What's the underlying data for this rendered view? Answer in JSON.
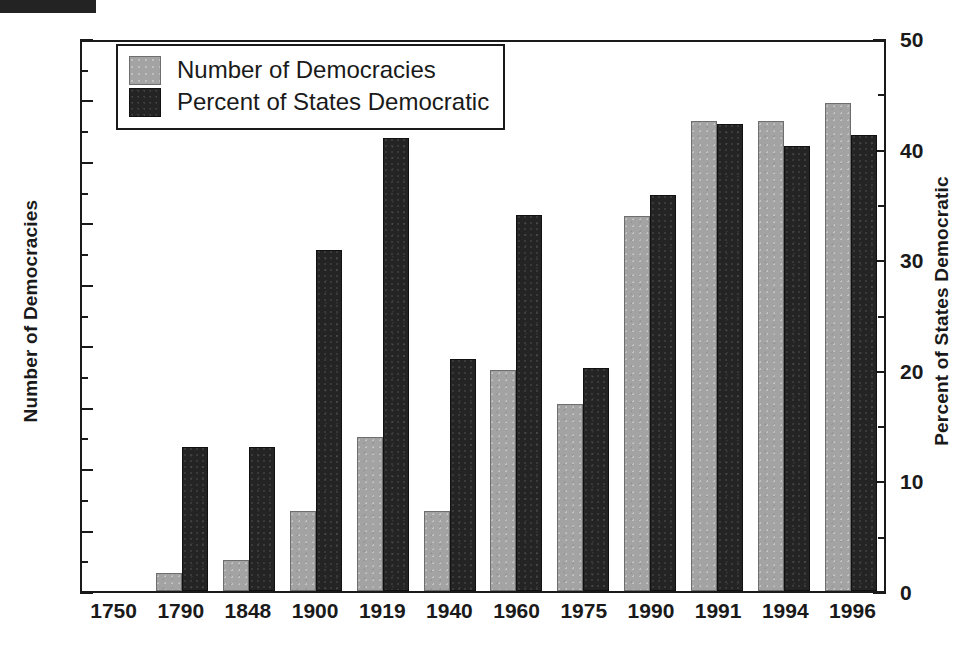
{
  "chart_data": {
    "type": "bar",
    "title": "",
    "subtitle": "",
    "xlabel": "",
    "ylabel": "Number of Democracies",
    "y2label": "Percent of States Democratic",
    "categories": [
      "1750",
      "1790",
      "1848",
      "1900",
      "1919",
      "1940",
      "1960",
      "1975",
      "1990",
      "1991",
      "1994",
      "1996"
    ],
    "series": [
      {
        "name": "Number of Democracies",
        "axis": "left",
        "color": "#a3a3a3",
        "values": [
          0,
          3,
          5,
          13,
          25,
          13,
          36,
          30.5,
          61,
          76.5,
          76.5,
          79.5
        ]
      },
      {
        "name": "Percent of States Democratic",
        "axis": "right",
        "color": "#242424",
        "values": [
          0,
          13,
          13,
          30.8,
          41,
          21,
          34,
          20.2,
          35.8,
          42.2,
          40.2,
          41.2
        ]
      }
    ],
    "ylim": [
      0,
      90
    ],
    "ytick_step": 10,
    "yticks": [
      0,
      10,
      20,
      30,
      40,
      50,
      60,
      70,
      80,
      90
    ],
    "y2lim": [
      0,
      50
    ],
    "y2tick_step": 10,
    "y2ticks": [
      0,
      10,
      20,
      30,
      40,
      50
    ],
    "minor_ticks": true,
    "grid": false,
    "legend_position": "top-left",
    "legend_entries": [
      "Number of Democracies",
      "Percent of States Democratic"
    ]
  },
  "legend": {
    "items": [
      {
        "label": "Number of Democracies",
        "swatch": "gray-swatch"
      },
      {
        "label": "Percent of States Democratic",
        "swatch": "black-swatch"
      }
    ]
  },
  "axes": {
    "left": {
      "title": "Number of Democracies",
      "ticks": [
        "90",
        "80",
        "70",
        "60",
        "50",
        "40",
        "30",
        "20",
        "10",
        "0"
      ]
    },
    "right": {
      "title": "Percent of States Democratic",
      "ticks": [
        "50",
        "40",
        "30",
        "20",
        "10",
        "0"
      ]
    },
    "bottom": {
      "ticks": [
        "1750",
        "1790",
        "1848",
        "1900",
        "1919",
        "1940",
        "1960",
        "1975",
        "1990",
        "1991",
        "1994",
        "1996"
      ]
    }
  }
}
